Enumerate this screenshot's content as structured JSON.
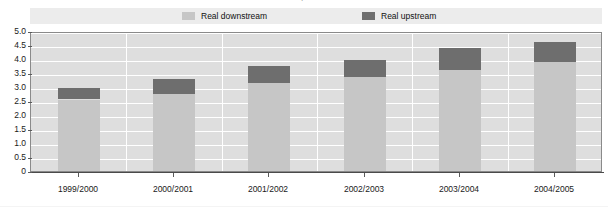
{
  "figure": {
    "title_sliver": "Oil price",
    "background_color": "#ffffff",
    "plot_background_color": "#dedede",
    "gridline_color": "#ffffff"
  },
  "legend": {
    "position": "top-center",
    "items": [
      {
        "label": "Real downstream",
        "color": "#c6c6c6",
        "swatch_name": "legend-swatch-downstream"
      },
      {
        "label": "Real upstream",
        "color": "#6e6e6e",
        "swatch_name": "legend-swatch-upstream"
      }
    ]
  },
  "yaxis": {
    "ticks": [
      "5.0",
      "4.5",
      "4.0",
      "3.5",
      "3.0",
      "2.5",
      "2.0",
      "1.5",
      "1.0",
      "0.5",
      "0"
    ],
    "min": 0,
    "max": 5.0,
    "step": 0.5,
    "label": ""
  },
  "xaxis": {
    "label": "",
    "categories": [
      "1999/2000",
      "2000/2001",
      "2001/2002",
      "2002/2003",
      "2003/2004",
      "2004/2005"
    ]
  },
  "chart_data": {
    "type": "bar",
    "stacked": true,
    "title": "",
    "subtitle": "",
    "xlabel": "",
    "ylabel": "",
    "ylim": [
      0,
      5.0
    ],
    "ytick_step": 0.5,
    "grid": true,
    "legend_position": "top-center",
    "categories": [
      "1999/2000",
      "2000/2001",
      "2001/2002",
      "2002/2003",
      "2003/2004",
      "2004/2005"
    ],
    "series": [
      {
        "name": "Real downstream",
        "color": "#c6c6c6",
        "values": [
          2.55,
          2.75,
          3.15,
          3.35,
          3.6,
          3.9
        ]
      },
      {
        "name": "Real upstream",
        "color": "#6e6e6e",
        "values": [
          0.4,
          0.55,
          0.6,
          0.6,
          0.8,
          0.7
        ]
      }
    ],
    "totals": [
      2.95,
      3.3,
      3.75,
      3.95,
      4.4,
      4.6
    ]
  }
}
